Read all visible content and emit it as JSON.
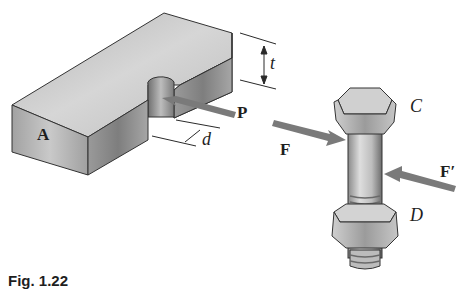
{
  "figure": {
    "caption": "Fig. 1.22",
    "left_part": {
      "block_label": "A",
      "thickness_label": "t",
      "diameter_label": "d",
      "force_label": "P"
    },
    "right_part": {
      "bolt_head_label": "C",
      "nut_label": "D",
      "force_left_label": "F",
      "force_right_label": "F′"
    },
    "colors": {
      "metal_light": "#d9d9d9",
      "metal_mid": "#a8a8a8",
      "metal_dark": "#6e6e6e",
      "arrow": "#7a7a7a",
      "line": "#2a2a2a"
    }
  }
}
